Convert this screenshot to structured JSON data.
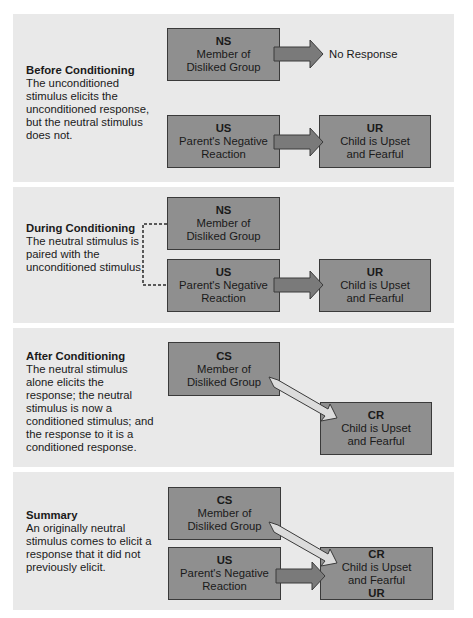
{
  "panels": [
    {
      "id": "before",
      "title": "Before Conditioning",
      "description": "The unconditioned stimulus elicits the unconditioned response, but the neutral stimulus does not.",
      "boxes": {
        "ns": {
          "abbr": "NS",
          "line1": "Member of",
          "line2": "Disliked Group"
        },
        "us": {
          "abbr": "US",
          "line1": "Parent's Negative",
          "line2": "Reaction"
        },
        "ur": {
          "abbr": "UR",
          "line1": "Child is Upset",
          "line2": "and Fearful"
        }
      },
      "no_response": "No Response"
    },
    {
      "id": "during",
      "title": "During Conditioning",
      "description": "The neutral stimulus is paired with the unconditioned stimulus.",
      "boxes": {
        "ns": {
          "abbr": "NS",
          "line1": "Member of",
          "line2": "Disliked Group"
        },
        "us": {
          "abbr": "US",
          "line1": "Parent's Negative",
          "line2": "Reaction"
        },
        "ur": {
          "abbr": "UR",
          "line1": "Child is Upset",
          "line2": "and Fearful"
        }
      }
    },
    {
      "id": "after",
      "title": "After Conditioning",
      "description": "The neutral stimulus alone elicits the response; the neutral stimulus is now a conditioned stimulus; and the response to it is a conditioned response.",
      "boxes": {
        "cs": {
          "abbr": "CS",
          "line1": "Member of",
          "line2": "Disliked Group"
        },
        "cr": {
          "abbr": "CR",
          "line1": "Child is Upset",
          "line2": "and Fearful"
        }
      }
    },
    {
      "id": "summary",
      "title": "Summary",
      "description": "An originally neutral stimulus comes to elicit a response that it did not previously elicit.",
      "boxes": {
        "cs": {
          "abbr": "CS",
          "line1": "Member of",
          "line2": "Disliked Group"
        },
        "us": {
          "abbr": "US",
          "line1": "Parent's Negative",
          "line2": "Reaction"
        },
        "cr": {
          "abbr": "CR",
          "line1": "Child is Upset",
          "line2": "and Fearful",
          "abbr2": "UR"
        }
      }
    }
  ],
  "colors": {
    "panel_bg": "#e9e9e9",
    "box_fill": "#8f8f8f",
    "box_border": "#3a3a3a",
    "arrow_dark": "#7a7a7a",
    "arrow_light": "#dcdcdc"
  }
}
